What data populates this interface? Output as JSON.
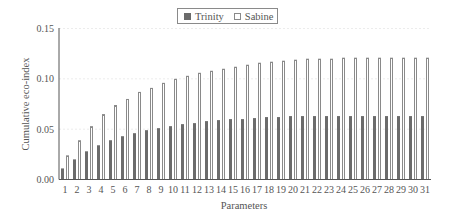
{
  "chart_data": {
    "type": "bar",
    "title": "",
    "xlabel": "Parameters",
    "ylabel": "Cumulative eco-index",
    "ylim": [
      0,
      0.15
    ],
    "yticks": [
      "0.00",
      "0.05",
      "0.10",
      "0.15"
    ],
    "grid": "faint horizontal at y ticks",
    "legend_position": "top-center",
    "categories": [
      "1",
      "2",
      "3",
      "4",
      "5",
      "6",
      "7",
      "8",
      "9",
      "10",
      "11",
      "12",
      "13",
      "14",
      "15",
      "16",
      "17",
      "18",
      "19",
      "20",
      "21",
      "22",
      "23",
      "24",
      "25",
      "26",
      "27",
      "28",
      "29",
      "30",
      "31"
    ],
    "series": [
      {
        "name": "Trinity",
        "style": "filled",
        "color": "#6b6b6b",
        "values": [
          0.011,
          0.02,
          0.028,
          0.034,
          0.039,
          0.043,
          0.046,
          0.049,
          0.051,
          0.053,
          0.055,
          0.056,
          0.058,
          0.059,
          0.06,
          0.06,
          0.061,
          0.062,
          0.062,
          0.063,
          0.063,
          0.063,
          0.063,
          0.063,
          0.063,
          0.063,
          0.063,
          0.063,
          0.063,
          0.063,
          0.063
        ]
      },
      {
        "name": "Sabine",
        "style": "hollow",
        "color": "#ffffff",
        "stroke": "#8a8a8a",
        "values": [
          0.024,
          0.039,
          0.053,
          0.065,
          0.074,
          0.08,
          0.087,
          0.091,
          0.096,
          0.1,
          0.103,
          0.106,
          0.108,
          0.11,
          0.112,
          0.114,
          0.116,
          0.117,
          0.118,
          0.119,
          0.12,
          0.12,
          0.12,
          0.121,
          0.121,
          0.121,
          0.121,
          0.121,
          0.121,
          0.121,
          0.121
        ]
      }
    ]
  },
  "legend": {
    "items": [
      {
        "label": "Trinity"
      },
      {
        "label": "Sabine"
      }
    ]
  }
}
